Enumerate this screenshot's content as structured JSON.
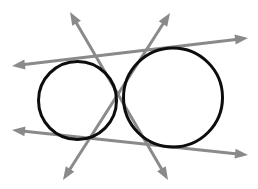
{
  "figure": {
    "description": "A small circle on the left and a larger circle on the right, each drawn in black outline, with four gray double-headed arrows representing the two external and two internal common tangent lines.",
    "canvas": {
      "width": 258,
      "height": 189,
      "background": "#ffffff"
    },
    "colors": {
      "circle_stroke": "#0d0d0d",
      "tangent_stroke": "#8a8a8a",
      "background": "#ffffff"
    },
    "circles": [
      {
        "name": "small-circle",
        "label": "Small circle (left)",
        "cx": 77.5,
        "cy": 100.5,
        "r": 39.0,
        "stroke_width": 3.0
      },
      {
        "name": "large-circle",
        "label": "Large circle (right)",
        "cx": 173.0,
        "cy": 97.5,
        "r": 49.5,
        "stroke_width": 3.0
      }
    ],
    "tangents": [
      {
        "name": "external-tangent-upper",
        "label": "Upper external tangent",
        "kind": "external",
        "stroke_width": 3.0,
        "x1": 12,
        "y1": 66,
        "x2": 248,
        "y2": 38,
        "arrow_start": true,
        "arrow_end": true
      },
      {
        "name": "external-tangent-lower",
        "label": "Lower external tangent",
        "kind": "external",
        "stroke_width": 3.0,
        "x1": 12,
        "y1": 130,
        "x2": 248,
        "y2": 155,
        "arrow_start": true,
        "arrow_end": true
      },
      {
        "name": "internal-tangent-left",
        "label": "Internal tangent rising to the left",
        "kind": "internal",
        "stroke_width": 3.0,
        "x1": 70,
        "y1": 12,
        "x2": 168,
        "y2": 180,
        "arrow_start": true,
        "arrow_end": true
      },
      {
        "name": "internal-tangent-right",
        "label": "Internal tangent rising to the right",
        "kind": "internal",
        "stroke_width": 3.0,
        "x1": 170,
        "y1": 13,
        "x2": 63,
        "y2": 180,
        "arrow_start": true,
        "arrow_end": true
      }
    ],
    "intersection": {
      "name": "internal-tangent-crossing",
      "label": "Internal tangents crossing point",
      "x": 124,
      "y": 99
    },
    "arrow_head": {
      "length": 13,
      "half_width": 5.0
    }
  }
}
